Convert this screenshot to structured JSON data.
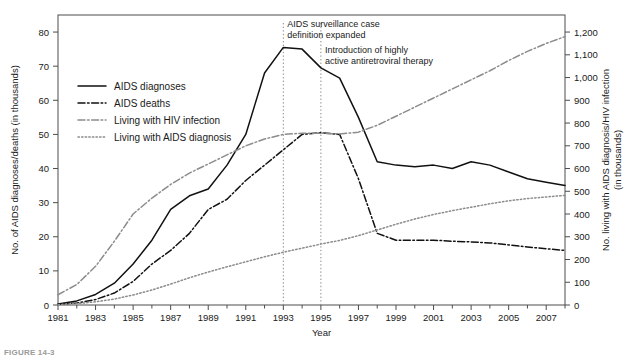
{
  "figure": {
    "caption": "FIGURE 14-3",
    "xlabel": "Year",
    "ylabel_left": "No. of AIDS diagnoses/deaths (in thousands)",
    "ylabel_right_line1": "No. living with AIDS diagnosis/HIV infection",
    "ylabel_right_line2": "(in thousands)"
  },
  "colors": {
    "axis": "#4d4d4d",
    "black_series": "#111111",
    "gray_series": "#8c8c8c",
    "annotation_line": "#8c8c8c",
    "background": "#ffffff"
  },
  "legend": {
    "items": [
      {
        "label": "AIDS diagnoses",
        "style": "solid",
        "color": "#111111"
      },
      {
        "label": "AIDS deaths",
        "style": "dash-dot",
        "color": "#111111"
      },
      {
        "label": "Living with HIV infection",
        "style": "dash-dot",
        "color": "#8c8c8c"
      },
      {
        "label": "Living with AIDS diagnosis",
        "style": "dotted",
        "color": "#8c8c8c"
      }
    ]
  },
  "annotations": [
    {
      "id": "case-definition",
      "line1": "AIDS surveillance case",
      "line2": "definition expanded",
      "year": 1993
    },
    {
      "id": "haart",
      "line1": "Introduction of highly",
      "line2": "active antiretroviral therapy",
      "year": 1995
    }
  ],
  "chart_data": {
    "type": "line",
    "title": "",
    "xlabel": "Year",
    "ylabel": "No. of AIDS diagnoses/deaths (in thousands)",
    "ylabel_secondary": "No. living with AIDS diagnosis/HIV infection (in thousands)",
    "xlim": [
      1981,
      2008
    ],
    "ylim": [
      0,
      85
    ],
    "ylim_secondary": [
      0,
      1275
    ],
    "grid": false,
    "legend_position": "upper-left-inside",
    "x_tick_labels": [
      "1981",
      "1983",
      "1985",
      "1987",
      "1989",
      "1991",
      "1993",
      "1995",
      "1997",
      "1999",
      "2001",
      "2003",
      "2005",
      "2007"
    ],
    "x_tick_values": [
      1981,
      1983,
      1985,
      1987,
      1989,
      1991,
      1993,
      1995,
      1997,
      1999,
      2001,
      2003,
      2005,
      2007
    ],
    "x_minor_ticks": [
      1982,
      1984,
      1986,
      1988,
      1990,
      1992,
      1994,
      1996,
      1998,
      2000,
      2002,
      2004,
      2006,
      2008
    ],
    "y_tick_labels_left": [
      "0",
      "10",
      "20",
      "30",
      "40",
      "50",
      "60",
      "70",
      "80"
    ],
    "y_tick_values_left": [
      0,
      10,
      20,
      30,
      40,
      50,
      60,
      70,
      80
    ],
    "y_tick_labels_right": [
      "0",
      "100",
      "200",
      "300",
      "400",
      "500",
      "600",
      "700",
      "800",
      "900",
      "1,000",
      "1,100",
      "1,200"
    ],
    "y_tick_values_right": [
      0,
      100,
      200,
      300,
      400,
      500,
      600,
      700,
      800,
      900,
      1000,
      1100,
      1200
    ],
    "x": [
      1981,
      1982,
      1983,
      1984,
      1985,
      1986,
      1987,
      1988,
      1989,
      1990,
      1991,
      1992,
      1993,
      1994,
      1995,
      1996,
      1997,
      1998,
      1999,
      2000,
      2001,
      2002,
      2003,
      2004,
      2005,
      2006,
      2007,
      2008
    ],
    "series": [
      {
        "name": "AIDS diagnoses",
        "axis": "left",
        "style": "solid",
        "color": "#111111",
        "values": [
          0.3,
          1.2,
          3.1,
          6.4,
          12.0,
          19.0,
          28.0,
          32.0,
          34.0,
          41.0,
          50.0,
          68.0,
          75.5,
          75.0,
          69.5,
          66.5,
          55.0,
          42.0,
          41.0,
          40.5,
          41.0,
          40.0,
          42.0,
          41.0,
          39.0,
          37.0,
          36.0,
          35.0
        ]
      },
      {
        "name": "AIDS deaths",
        "axis": "left",
        "style": "dash-dot",
        "color": "#111111",
        "values": [
          0.2,
          0.6,
          1.6,
          3.5,
          6.9,
          12.0,
          16.0,
          21.0,
          28.0,
          31.0,
          36.5,
          41.0,
          45.5,
          50.0,
          50.5,
          50.0,
          37.0,
          21.0,
          19.0,
          19.0,
          19.0,
          18.7,
          18.5,
          18.2,
          17.6,
          17.0,
          16.5,
          16.0
        ]
      },
      {
        "name": "Living with HIV infection",
        "axis": "right",
        "style": "dash-dot",
        "color": "#8c8c8c",
        "values": [
          45,
          90,
          170,
          280,
          400,
          470,
          530,
          580,
          620,
          660,
          700,
          730,
          750,
          755,
          755,
          752,
          760,
          790,
          830,
          870,
          910,
          950,
          990,
          1030,
          1075,
          1115,
          1150,
          1180
        ]
      },
      {
        "name": "Living with AIDS diagnosis",
        "axis": "right",
        "style": "dotted",
        "color": "#8c8c8c",
        "values": [
          2,
          6,
          14,
          26,
          44,
          66,
          92,
          120,
          145,
          168,
          190,
          212,
          232,
          250,
          268,
          284,
          305,
          330,
          355,
          378,
          398,
          415,
          430,
          445,
          458,
          468,
          475,
          482
        ]
      }
    ]
  }
}
